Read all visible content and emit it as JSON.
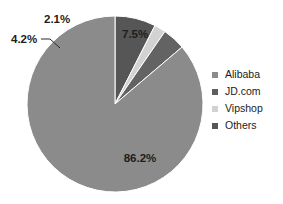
{
  "chart_data": {
    "type": "pie",
    "title": "",
    "subtitle": "",
    "xlabel": "",
    "ylabel": "",
    "grid": false,
    "legend_position": "right",
    "start_angle_deg": 0,
    "direction": "clockwise",
    "units": "percent",
    "categories": [
      "Alibaba",
      "JD.com",
      "Vipshop",
      "Others"
    ],
    "values": [
      86.2,
      4.2,
      2.1,
      7.5
    ],
    "slice_draw_order": [
      "Others",
      "Vipshop",
      "JD.com",
      "Alibaba"
    ],
    "colors": [
      "#8b8b8b",
      "#636363",
      "#d2d2d2",
      "#565656"
    ],
    "slices": [
      {
        "label": "Alibaba",
        "value": 86.2,
        "value_text": "86.2%",
        "color": "#8b8b8b",
        "label_x": 140,
        "label_y": 162,
        "anchor": "middle",
        "has_leader": false
      },
      {
        "label": "JD.com",
        "value": 4.2,
        "value_text": "4.2%",
        "color": "#636363",
        "label_x": 11,
        "label_y": 43,
        "anchor": "start",
        "has_leader": true
      },
      {
        "label": "Vipshop",
        "value": 2.1,
        "value_text": "2.1%",
        "color": "#d2d2d2",
        "label_x": 44,
        "label_y": 23,
        "anchor": "start",
        "has_leader": false
      },
      {
        "label": "Others",
        "value": 7.5,
        "value_text": "7.5%",
        "color": "#565656",
        "label_x": 122,
        "label_y": 38,
        "anchor": "start",
        "has_leader": false
      }
    ],
    "geometry": {
      "center_x": 115,
      "center_y": 104,
      "radius": 88
    }
  },
  "legend": {
    "items": [
      {
        "label": "Alibaba",
        "color": "#8b8b8b"
      },
      {
        "label": "JD.com",
        "color": "#5f5f5f"
      },
      {
        "label": "Vipshop",
        "color": "#d2d2d2"
      },
      {
        "label": "Others",
        "color": "#565656"
      }
    ]
  },
  "labels": {
    "alibaba_pct": "86.2%",
    "jd_pct": "4.2%",
    "vipshop_pct": "2.1%",
    "others_pct": "7.5%"
  }
}
